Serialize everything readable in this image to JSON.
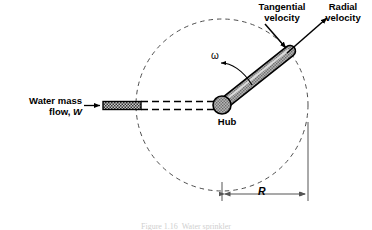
{
  "figure": {
    "caption_clipped": "Figure 1.16  Water sprinkler"
  },
  "labels": {
    "tangential_velocity": "Tangential\nvelocity",
    "radial_velocity": "Radial\nvelocity",
    "water_mass_flow_line1": "Water mass",
    "water_mass_flow_line2": "flow, ",
    "water_mass_flow_symbol": "W",
    "hub": "Hub",
    "omega": "ω",
    "radius": "R"
  },
  "colors": {
    "stroke": "#000000",
    "arm_fill": "#a9a9a9",
    "arm_highlight": "#d8d8d8",
    "hub_fill": "#a9a9a9",
    "pipe_fill": "#8c8c8c",
    "dashed_circle": "#4d4d4d",
    "dimension_line": "#555555",
    "background": "#ffffff"
  },
  "geometry": {
    "hub_center_x": 222,
    "hub_center_y": 105,
    "hub_radius": 9,
    "trajectory_circle_radius": 86,
    "arm_tip_x": 289,
    "arm_tip_y": 52,
    "arm_angle_deg": -38,
    "radius_dimension_label": "R",
    "radius_dimension_from_x": 222,
    "radius_dimension_to_x": 308,
    "radius_dimension_y": 194
  }
}
